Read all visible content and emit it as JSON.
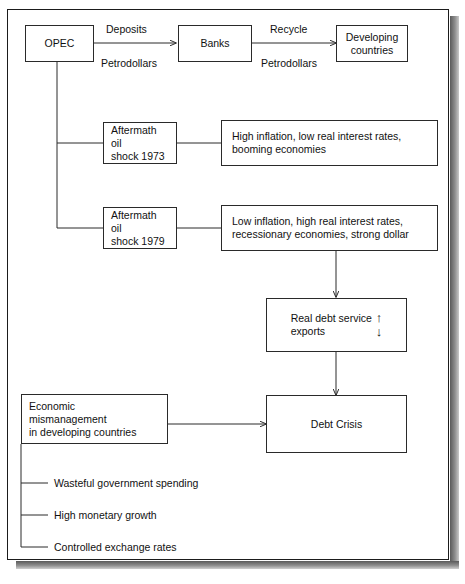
{
  "figure": {
    "frame_color": "#1b1b1b",
    "shadow_color": "#6b6b6b",
    "line_color": "#2a2a2a"
  },
  "nodes": {
    "opec": {
      "label": "OPEC"
    },
    "banks": {
      "label": "Banks"
    },
    "developing_countries": {
      "line1": "Developing",
      "line2": "countries"
    },
    "shock_1973": {
      "line1": "Aftermath oil",
      "line2": "shock 1973"
    },
    "shock_1979": {
      "line1": "Aftermath oil",
      "line2": "shock 1979"
    },
    "effects_1973": {
      "line1": "High inflation, low real interest rates,",
      "line2": "booming economies"
    },
    "effects_1979": {
      "line1": "Low inflation, high real interest rates,",
      "line2": "recessionary economies, strong dollar"
    },
    "debt_service_ratio": {
      "numerator": "Real debt service",
      "denominator": "exports",
      "up_arrow": "↑",
      "down_arrow": "↓"
    },
    "debt_crisis": {
      "label": "Debt Crisis"
    },
    "economic_mismanagement": {
      "line1": "Economic",
      "line2": "mismanagement",
      "line3": "in developing countries"
    }
  },
  "edge_labels": {
    "deposits": "Deposits",
    "petrodollars_left": "Petrodollars",
    "recycle": "Recycle",
    "petrodollars_right": "Petrodollars"
  },
  "mismanagement_causes": [
    "Wasteful government spending",
    "High monetary growth",
    "Controlled exchange rates"
  ]
}
